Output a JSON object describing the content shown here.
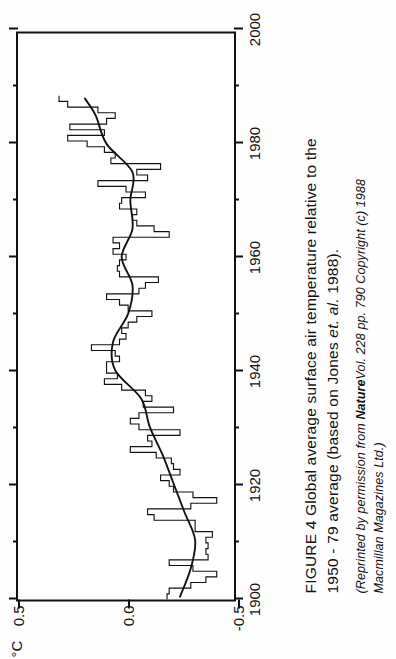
{
  "figure": {
    "caption_line1": "FIGURE 4  Global average surface air temperature relative to the",
    "caption_line2": "1950 - 79 average (based on Jones",
    "caption_line2_italic": "et. al.",
    "caption_line2_end": "1988).",
    "source_line1_pre": "(Reprinted by permission from",
    "source_line1_bold": "Nature",
    "source_line1_post": "Vol. 228 pp. 790 Copyright (c) 1988",
    "source_line2": "Macmillan Magazines Ltd.)",
    "unit_label": "°C"
  },
  "chart_data": {
    "type": "line",
    "title": "Global average surface air temperature relative to the 1950 - 79 average",
    "xlabel": "",
    "ylabel": "°C",
    "xlim": [
      1900,
      2000
    ],
    "ylim": [
      -0.5,
      0.5
    ],
    "xticks": [
      1900,
      1920,
      1940,
      1960,
      1980,
      2000
    ],
    "xtick_labels": [
      "1900",
      "1920",
      "1940",
      "1960",
      "1980",
      "2000"
    ],
    "xminorticks": [
      1910,
      1930,
      1950,
      1970,
      1990
    ],
    "yticks": [
      -0.5,
      0.0,
      0.5
    ],
    "ytick_labels": [
      "-0.5",
      "0.0",
      "0.5"
    ],
    "grid": false,
    "legend": null,
    "series": [
      {
        "name": "Annual mean anomaly",
        "style": "step",
        "x": [
          1900,
          1901,
          1902,
          1903,
          1904,
          1905,
          1906,
          1907,
          1908,
          1909,
          1910,
          1911,
          1912,
          1913,
          1914,
          1915,
          1916,
          1917,
          1918,
          1919,
          1920,
          1921,
          1922,
          1923,
          1924,
          1925,
          1926,
          1927,
          1928,
          1929,
          1930,
          1931,
          1932,
          1933,
          1934,
          1935,
          1936,
          1937,
          1938,
          1939,
          1940,
          1941,
          1942,
          1943,
          1944,
          1945,
          1946,
          1947,
          1948,
          1949,
          1950,
          1951,
          1952,
          1953,
          1954,
          1955,
          1956,
          1957,
          1958,
          1959,
          1960,
          1961,
          1962,
          1963,
          1964,
          1965,
          1966,
          1967,
          1968,
          1969,
          1970,
          1971,
          1972,
          1973,
          1974,
          1975,
          1976,
          1977,
          1978,
          1979,
          1980,
          1981,
          1982,
          1983,
          1984,
          1985,
          1986,
          1987,
          1988
        ],
        "values": [
          -0.19,
          -0.2,
          -0.3,
          -0.37,
          -0.42,
          -0.31,
          -0.2,
          -0.38,
          -0.37,
          -0.38,
          -0.37,
          -0.4,
          -0.32,
          -0.32,
          -0.13,
          -0.1,
          -0.3,
          -0.42,
          -0.31,
          -0.22,
          -0.2,
          -0.16,
          -0.25,
          -0.22,
          -0.21,
          -0.14,
          -0.02,
          -0.12,
          -0.1,
          -0.25,
          -0.06,
          -0.02,
          -0.06,
          -0.22,
          -0.08,
          -0.12,
          -0.09,
          0.02,
          0.1,
          0.04,
          0.09,
          0.09,
          0.03,
          0.05,
          0.16,
          0.03,
          0.0,
          0.02,
          -0.01,
          -0.05,
          -0.12,
          -0.01,
          0.03,
          0.09,
          -0.06,
          -0.09,
          -0.15,
          0.03,
          0.04,
          0.03,
          0.0,
          0.06,
          0.03,
          0.06,
          -0.2,
          -0.13,
          -0.05,
          -0.03,
          -0.05,
          0.03,
          0.02,
          -0.09,
          0.0,
          0.13,
          -0.1,
          -0.05,
          -0.16,
          0.07,
          0.05,
          0.1,
          0.18,
          0.27,
          0.1,
          0.26,
          0.09,
          0.05,
          0.13,
          0.27,
          0.31
        ]
      },
      {
        "name": "Smoothed (filtered) curve",
        "style": "smooth",
        "x": [
          1900,
          1905,
          1910,
          1915,
          1920,
          1925,
          1930,
          1935,
          1940,
          1945,
          1950,
          1955,
          1960,
          1965,
          1970,
          1975,
          1980,
          1985,
          1988
        ],
        "values": [
          -0.25,
          -0.3,
          -0.32,
          -0.27,
          -0.22,
          -0.17,
          -0.11,
          -0.07,
          0.05,
          0.06,
          -0.01,
          -0.03,
          0.02,
          -0.03,
          -0.02,
          -0.03,
          0.09,
          0.14,
          0.19
        ]
      }
    ]
  }
}
